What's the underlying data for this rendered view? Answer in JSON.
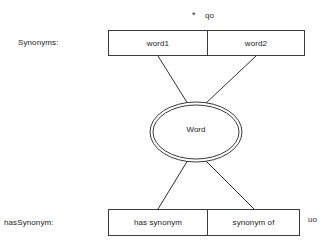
{
  "diagram": {
    "entity": {
      "label": "Word",
      "shape": "double-ellipse"
    },
    "rows": [
      {
        "name": "synonyms",
        "label": "Synonyms:",
        "cells": [
          {
            "label": "word1"
          },
          {
            "label": "word2"
          }
        ]
      },
      {
        "name": "hasSynonym",
        "label": "hasSynonym:",
        "cells": [
          {
            "label": "has synonym"
          },
          {
            "label": "synonym of"
          }
        ]
      }
    ],
    "stray_marks": [
      {
        "name": "asterisk",
        "text": "*"
      },
      {
        "name": "qo",
        "text": "qo"
      },
      {
        "name": "uo",
        "text": "uo"
      }
    ],
    "colors": {
      "stroke": "#3a3a3a",
      "line": "#2e2e2e",
      "text": "#1a1a1a",
      "background": "#ffffff"
    }
  }
}
